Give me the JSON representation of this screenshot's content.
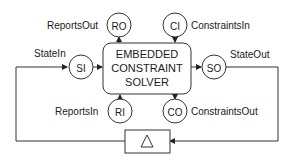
{
  "diagram": {
    "main_block": {
      "lines": [
        "EMBEDDED",
        "CONSTRAINT",
        "SOLVER"
      ]
    },
    "ports": {
      "SI": {
        "abbr": "SI",
        "label": "StateIn"
      },
      "SO": {
        "abbr": "SO",
        "label": "StateOut"
      },
      "RO": {
        "abbr": "RO",
        "label": "ReportsOut"
      },
      "CI": {
        "abbr": "CI",
        "label": "ConstraintsIn"
      },
      "RI": {
        "abbr": "RI",
        "label": "ReportsIn"
      },
      "CO": {
        "abbr": "CO",
        "label": "ConstraintsOut"
      }
    },
    "delay_block": {
      "symbol": "△"
    }
  }
}
